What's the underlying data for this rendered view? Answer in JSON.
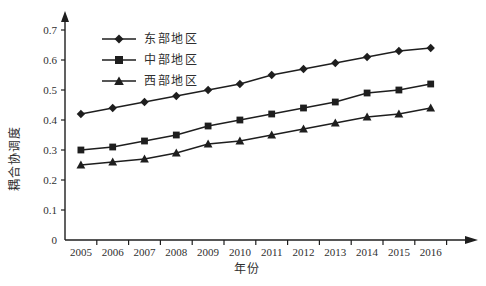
{
  "colors": {
    "background": "#ffffff",
    "line": "#1e1e1e",
    "text": "#2f2f2f"
  },
  "chart_data": {
    "type": "line",
    "title": "",
    "xlabel": "年份",
    "ylabel": "耦合协调度",
    "categories": [
      "2005",
      "2006",
      "2007",
      "2008",
      "2009",
      "2010",
      "2011",
      "2012",
      "2013",
      "2014",
      "2015",
      "2016"
    ],
    "y_ticks": [
      "0",
      "0.1",
      "0.2",
      "0.3",
      "0.4",
      "0.5",
      "0.6",
      "0.7"
    ],
    "ylim": [
      0,
      0.75
    ],
    "grid": false,
    "legend_position": "inside-top-left",
    "series": [
      {
        "name": "东部地区",
        "marker": "diamond",
        "color": "#1e1e1e",
        "values": [
          0.42,
          0.44,
          0.46,
          0.48,
          0.5,
          0.52,
          0.55,
          0.57,
          0.59,
          0.61,
          0.63,
          0.64
        ]
      },
      {
        "name": "中部地区",
        "marker": "square",
        "color": "#1e1e1e",
        "values": [
          0.3,
          0.31,
          0.33,
          0.35,
          0.38,
          0.4,
          0.42,
          0.44,
          0.46,
          0.49,
          0.5,
          0.52
        ]
      },
      {
        "name": "西部地区",
        "marker": "triangle",
        "color": "#1e1e1e",
        "values": [
          0.25,
          0.26,
          0.27,
          0.29,
          0.32,
          0.33,
          0.35,
          0.37,
          0.39,
          0.41,
          0.42,
          0.44
        ]
      }
    ]
  }
}
